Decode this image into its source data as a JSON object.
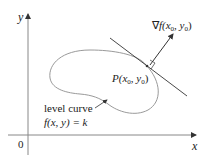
{
  "diagram": {
    "axes": {
      "x_label": "x",
      "y_label": "y",
      "origin_label": "0"
    },
    "point_label": {
      "P": "P",
      "args": "(x",
      "sub0a": "0",
      "comma": ", y",
      "sub0b": "0",
      "close": ")"
    },
    "gradient_label": {
      "nabla": "∇",
      "f": "f",
      "args": "(x",
      "sub0a": "0",
      "comma": ", y",
      "sub0b": "0",
      "close": ")"
    },
    "curve_label": {
      "line1": "level curve",
      "line2": "f(x, y) = k"
    },
    "colors": {
      "curve": "#9a9a9a",
      "axes": "#777777",
      "lines": "#333333"
    }
  }
}
